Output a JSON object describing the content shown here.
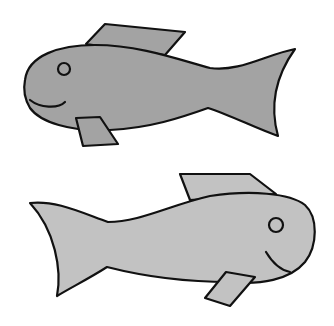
{
  "scene": {
    "description": "Two cartoon fish drawings, one above the other, facing opposite directions",
    "background": "#ffffff",
    "fish": [
      {
        "name": "top-fish",
        "facing": "left",
        "body_color": "#a3a3a3",
        "outline_color": "#111111"
      },
      {
        "name": "bottom-fish",
        "facing": "right",
        "body_color": "#c2c2c2",
        "outline_color": "#111111"
      }
    ]
  }
}
